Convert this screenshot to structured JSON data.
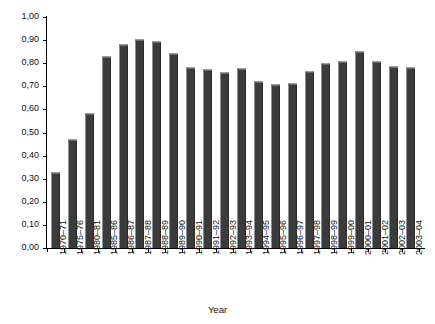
{
  "chart_data": {
    "type": "bar",
    "title": "",
    "xlabel": "Year",
    "ylabel": "",
    "ylim": [
      0.0,
      1.0
    ],
    "ytick_step": 0.1,
    "decimal_separator": ",",
    "grid": false,
    "legend": null,
    "bar_color": "#3b3b3b",
    "categories": [
      "1970–71",
      "1975–76",
      "1980–81",
      "1985–86",
      "1986–87",
      "1987–88",
      "1988–89",
      "1989–90",
      "1990–91",
      "1991–92",
      "1992–93",
      "1993–94",
      "1994–95",
      "1995–96",
      "1996–97",
      "1997–98",
      "1998–99",
      "1999–00",
      "2000–01",
      "2001–02",
      "2002–03",
      "2003–04"
    ],
    "values": [
      0.33,
      0.47,
      0.585,
      0.83,
      0.885,
      0.905,
      0.895,
      0.845,
      0.785,
      0.775,
      0.76,
      0.78,
      0.725,
      0.71,
      0.715,
      0.765,
      0.8,
      0.81,
      0.855,
      0.81,
      0.79,
      0.785
    ],
    "ytick_labels": [
      "0,00",
      "0,10",
      "0,20",
      "0,30",
      "0,40",
      "0,50",
      "0,60",
      "0,70",
      "0,80",
      "0,90",
      "1,00"
    ],
    "ytick_values": [
      0.0,
      0.1,
      0.2,
      0.3,
      0.4,
      0.5,
      0.6,
      0.7,
      0.8,
      0.9,
      1.0
    ]
  }
}
